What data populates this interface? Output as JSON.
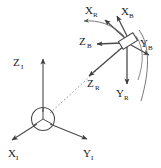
{
  "figure": {
    "background_color": "#ffffff",
    "line_color": "#3c3c3c",
    "text_color": "#1a1a1a",
    "width": 161,
    "height": 168
  },
  "frames": {
    "inertial": {
      "name": "Inertial frame",
      "subscript": "I",
      "origin": {
        "x": 43,
        "y": 119
      },
      "origin_marker": "circle-with-triad",
      "axes": [
        {
          "id": "x-inertial",
          "label": "X",
          "subscript": "I",
          "label_x": 8,
          "label_y": 155,
          "tip_x": 8,
          "tip_y": 140
        },
        {
          "id": "y-inertial",
          "label": "Y",
          "subscript": "I",
          "label_x": 84,
          "label_y": 155,
          "tip_x": 90,
          "tip_y": 140
        },
        {
          "id": "z-inertial",
          "label": "Z",
          "subscript": "I",
          "label_x": 13,
          "label_y": 66,
          "tip_x": 43,
          "tip_y": 57
        }
      ]
    },
    "body": {
      "name": "Body frame",
      "subscript": "B",
      "origin": {
        "x": 128,
        "y": 41
      },
      "origin_marker": "rotated-rectangle-vehicle",
      "axes": [
        {
          "id": "x-body",
          "label": "X",
          "subscript": "B",
          "label_x": 122,
          "label_y": 13,
          "tip_x": 118,
          "tip_y": 17
        },
        {
          "id": "y-body",
          "label": "Y",
          "subscript": "B",
          "label_x": 141,
          "label_y": 45,
          "tip_x": 148,
          "tip_y": 53
        },
        {
          "id": "z-body",
          "label": "Z",
          "subscript": "B",
          "label_x": 80,
          "label_y": 44,
          "tip_x": 98,
          "tip_y": 44
        }
      ]
    },
    "reference": {
      "name": "Reference frame",
      "subscript": "R",
      "origin": {
        "x": 128,
        "y": 41
      },
      "axes": [
        {
          "id": "x-reference",
          "label": "X",
          "subscript": "R",
          "label_x": 88,
          "label_y": 13,
          "tip_x": 84,
          "tip_y": 19
        },
        {
          "id": "y-reference",
          "label": "Y",
          "subscript": "R",
          "label_x": 117,
          "label_y": 96,
          "tip_x": 122,
          "tip_y": 83
        },
        {
          "id": "z-reference",
          "label": "Z",
          "subscript": "R",
          "label_x": 88,
          "label_y": 86,
          "tip_x": 90,
          "tip_y": 74
        }
      ]
    }
  },
  "connectors": {
    "position_vector": {
      "name": "dashed position vector from inertial origin to body origin",
      "style": "dashed",
      "from": {
        "x": 50,
        "y": 113
      },
      "to": {
        "x": 122,
        "y": 47
      }
    }
  },
  "rotation_arcs": [
    {
      "id": "arc-x-rotation",
      "name": "rotation arc from X-body to X-reference"
    },
    {
      "id": "arc-y-rotation",
      "name": "rotation arc from Y-body downward"
    },
    {
      "id": "arc-outer-sweep",
      "name": "outer rotation sweep arc"
    }
  ]
}
